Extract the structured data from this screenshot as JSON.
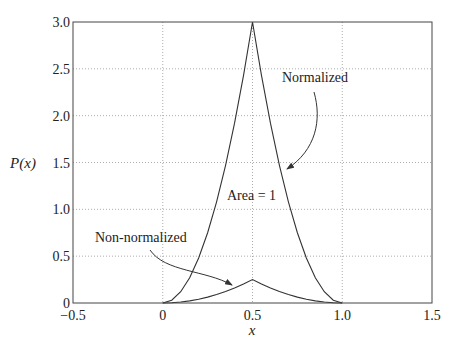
{
  "chart_data": {
    "type": "line",
    "title": "",
    "xlabel": "x",
    "ylabel": "P(x)",
    "xlim": [
      -0.5,
      1.5
    ],
    "ylim": [
      0,
      3.0
    ],
    "grid": true,
    "x_ticks": [
      -0.5,
      0,
      0.5,
      1.0,
      1.5
    ],
    "x_tick_labels": [
      "-0.5",
      "0",
      "0.5",
      "1.0",
      "1.5"
    ],
    "y_ticks": [
      0,
      0.5,
      1.0,
      1.5,
      2.0,
      2.5,
      3.0
    ],
    "y_tick_labels": [
      "0",
      "0.5",
      "1.0",
      "1.5",
      "2.0",
      "2.5",
      "3.0"
    ],
    "series": [
      {
        "name": "Normalized",
        "description": "Piecewise quadratic peaking at x=0.5, area = 1",
        "x": [
          0,
          0.05,
          0.1,
          0.15,
          0.2,
          0.25,
          0.3,
          0.35,
          0.4,
          0.45,
          0.5,
          0.55,
          0.6,
          0.65,
          0.7,
          0.75,
          0.8,
          0.85,
          0.9,
          0.95,
          1.0
        ],
        "y": [
          0,
          0.03,
          0.12,
          0.27,
          0.48,
          0.75,
          1.08,
          1.47,
          1.92,
          2.43,
          3.0,
          2.43,
          1.92,
          1.47,
          1.08,
          0.75,
          0.48,
          0.27,
          0.12,
          0.03,
          0
        ]
      },
      {
        "name": "Non-normalized",
        "description": "Same shape scaled, peak 0.25 at x=0.5",
        "x": [
          0,
          0.05,
          0.1,
          0.15,
          0.2,
          0.25,
          0.3,
          0.35,
          0.4,
          0.45,
          0.5,
          0.55,
          0.6,
          0.65,
          0.7,
          0.75,
          0.8,
          0.85,
          0.9,
          0.95,
          1.0
        ],
        "y": [
          0,
          0.0025,
          0.01,
          0.0225,
          0.04,
          0.0625,
          0.09,
          0.1225,
          0.16,
          0.2025,
          0.25,
          0.2025,
          0.16,
          0.1225,
          0.09,
          0.0625,
          0.04,
          0.0225,
          0.01,
          0.0025,
          0
        ]
      }
    ],
    "annotations": [
      {
        "text": "Normalized",
        "arrow_to": "Normalized curve right flank near x=0.7"
      },
      {
        "text": "Area = 1",
        "position": "inside normalized curve"
      },
      {
        "text": "Non-normalized",
        "arrow_to": "Non-normalized curve near x=0.45"
      }
    ]
  },
  "labels": {
    "xlabel": "x",
    "ylabel": "P(x)",
    "annotation_normalized": "Normalized",
    "annotation_area": "Area = 1",
    "annotation_non_normalized": "Non-normalized"
  }
}
